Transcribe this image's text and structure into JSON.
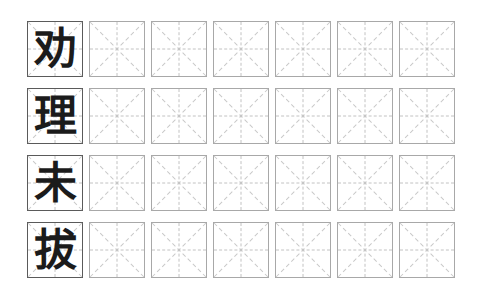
{
  "worksheet": {
    "title": "Chinese Character Handwriting Practice Sheet",
    "grid_style": "mizige",
    "columns": 7,
    "rows": 4,
    "background_color": "#ffffff",
    "filled_cell_border_color": "#5a5a5a",
    "empty_cell_border_color": "#a8a8a8",
    "guide_line_color": "#c2c2c2",
    "glyph_color": "#1b1b1b",
    "rows_data": [
      {
        "index": 1,
        "character": "劝",
        "cells": [
          {
            "character": "劝",
            "filled": true
          },
          {
            "character": "",
            "filled": false
          },
          {
            "character": "",
            "filled": false
          },
          {
            "character": "",
            "filled": false
          },
          {
            "character": "",
            "filled": false
          },
          {
            "character": "",
            "filled": false
          },
          {
            "character": "",
            "filled": false
          }
        ]
      },
      {
        "index": 2,
        "character": "理",
        "cells": [
          {
            "character": "理",
            "filled": true
          },
          {
            "character": "",
            "filled": false
          },
          {
            "character": "",
            "filled": false
          },
          {
            "character": "",
            "filled": false
          },
          {
            "character": "",
            "filled": false
          },
          {
            "character": "",
            "filled": false
          },
          {
            "character": "",
            "filled": false
          }
        ]
      },
      {
        "index": 3,
        "character": "未",
        "cells": [
          {
            "character": "未",
            "filled": true
          },
          {
            "character": "",
            "filled": false
          },
          {
            "character": "",
            "filled": false
          },
          {
            "character": "",
            "filled": false
          },
          {
            "character": "",
            "filled": false
          },
          {
            "character": "",
            "filled": false
          },
          {
            "character": "",
            "filled": false
          }
        ]
      },
      {
        "index": 4,
        "character": "拔",
        "cells": [
          {
            "character": "拔",
            "filled": true
          },
          {
            "character": "",
            "filled": false
          },
          {
            "character": "",
            "filled": false
          },
          {
            "character": "",
            "filled": false
          },
          {
            "character": "",
            "filled": false
          },
          {
            "character": "",
            "filled": false
          },
          {
            "character": "",
            "filled": false
          }
        ]
      }
    ]
  }
}
